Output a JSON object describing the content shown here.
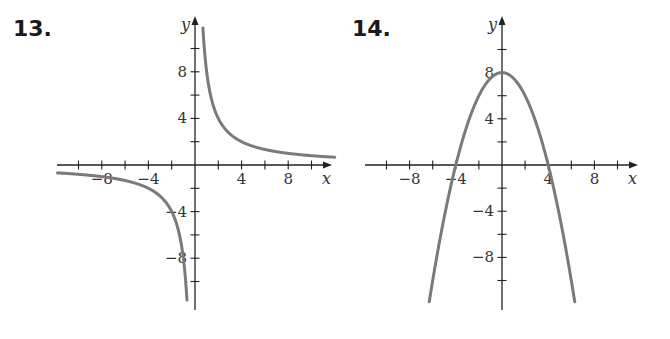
{
  "page": {
    "background": "#ffffff",
    "curve_color": "#7a7a7a",
    "axis_color": "#222222"
  },
  "panels": [
    {
      "number": "13."
    },
    {
      "number": "14."
    }
  ],
  "chart_data": [
    {
      "type": "line",
      "title": "13.",
      "function": "y = 8/x",
      "xlabel": "x",
      "ylabel": "y",
      "xlim": [
        -12,
        12
      ],
      "ylim": [
        -12,
        12
      ],
      "x_ticks_every": 2,
      "y_ticks_every": 2,
      "x_tick_labels": [
        "-8",
        "-4",
        "4",
        "8"
      ],
      "y_tick_labels": [
        "8",
        "4",
        "-4",
        "-8"
      ],
      "grid": false,
      "series": [
        {
          "name": "branch-positive",
          "x": [
            0.7,
            1,
            2,
            4,
            8,
            12
          ],
          "y": [
            11.4,
            8,
            4,
            2,
            1,
            0.67
          ]
        },
        {
          "name": "branch-negative",
          "x": [
            -12,
            -8,
            -4,
            -2,
            -1,
            -0.7
          ],
          "y": [
            -0.67,
            -1,
            -2,
            -4,
            -8,
            -11.4
          ]
        }
      ],
      "asymptotes": {
        "vertical": 0,
        "horizontal": 0
      }
    },
    {
      "type": "line",
      "title": "14.",
      "function": "y = 8 - x^2/2",
      "xlabel": "x",
      "ylabel": "y",
      "xlim": [
        -12,
        12
      ],
      "ylim": [
        -12,
        12
      ],
      "x_ticks_every": 2,
      "y_ticks_every": 2,
      "x_tick_labels": [
        "-8",
        "-4",
        "4",
        "8"
      ],
      "y_tick_labels": [
        "8",
        "4",
        "-4",
        "-8"
      ],
      "grid": false,
      "series": [
        {
          "name": "parabola",
          "x": [
            -6.3,
            -4,
            -2,
            0,
            2,
            4,
            6.3
          ],
          "y": [
            -11.8,
            0,
            6,
            8,
            6,
            0,
            -11.8
          ]
        }
      ],
      "vertex": [
        0,
        8
      ],
      "x_intercepts": [
        -4,
        4
      ]
    }
  ]
}
